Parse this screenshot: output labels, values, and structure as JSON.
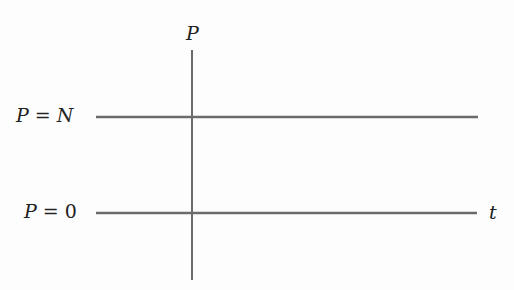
{
  "diagram": {
    "axis_label_vertical": "P",
    "axis_label_horizontal": "t",
    "equilibria": [
      {
        "label": "P = N",
        "var": "P",
        "eq": "=",
        "val": "N"
      },
      {
        "label": "P = 0",
        "var": "P",
        "eq": "=",
        "val": "0"
      }
    ],
    "line_color": "#6b6b6b"
  }
}
